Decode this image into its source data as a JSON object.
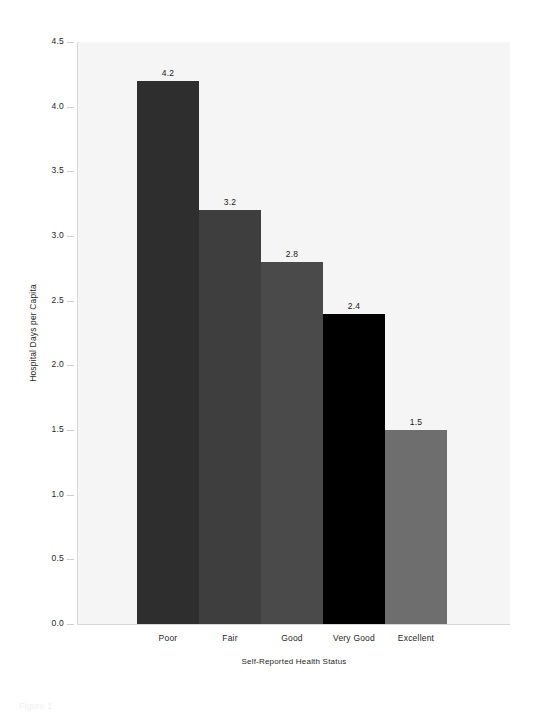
{
  "chart_data": {
    "type": "bar",
    "title": "",
    "subtitle": "",
    "categories": [
      "Poor",
      "Fair",
      "Good",
      "Very Good",
      "Excellent"
    ],
    "values": [
      4.2,
      3.2,
      2.8,
      2.4,
      1.5
    ],
    "value_labels": [
      "4.2",
      "3.2",
      "2.8",
      "2.4",
      "1.5"
    ],
    "bar_colors": [
      "#2e2e2e",
      "#3e3e3e",
      "#4a4a4a",
      "#000000",
      "#6e6e6e"
    ],
    "xlabel": "Self-Reported Health Status",
    "ylabel": "Hospital Days per Capita",
    "ylim": [
      0.0,
      4.5
    ],
    "ytick_labels": [
      "0.0",
      "0.5",
      "1.0",
      "1.5",
      "2.0",
      "2.5",
      "3.0",
      "3.5",
      "4.0",
      "4.5"
    ],
    "ytick_values": [
      0.0,
      0.5,
      1.0,
      1.5,
      2.0,
      2.5,
      3.0,
      3.5,
      4.0,
      4.5
    ],
    "grid": false,
    "legend": null,
    "plot_background_color": "#f5f5f5",
    "figure_background_color": "#ffffff",
    "axis_color": "#d8d8d8",
    "bar_gap": 0
  },
  "caption": {
    "text": "Figure 1"
  }
}
